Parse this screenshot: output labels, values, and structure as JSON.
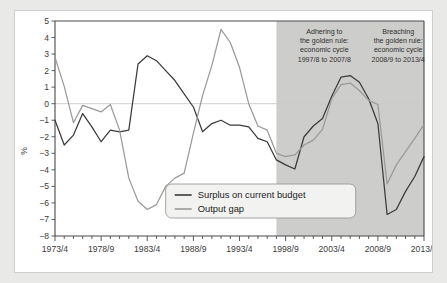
{
  "chart_data": {
    "type": "line",
    "title": "",
    "xlabel": "",
    "ylabel": "%",
    "ylim": [
      -8,
      5
    ],
    "yticks": [
      5,
      4,
      3,
      2,
      1,
      0,
      -1,
      -2,
      -3,
      -4,
      -5,
      -6,
      -7,
      -8
    ],
    "grid": false,
    "zero_line": true,
    "legend_position": "bottom-center",
    "x": [
      "1973/4",
      "1974/5",
      "1975/6",
      "1976/7",
      "1977/8",
      "1978/9",
      "1979/80",
      "1980/1",
      "1981/2",
      "1982/3",
      "1983/4",
      "1984/5",
      "1985/6",
      "1986/7",
      "1987/8",
      "1988/9",
      "1989/90",
      "1990/1",
      "1991/2",
      "1992/3",
      "1993/4",
      "1994/5",
      "1995/6",
      "1996/7",
      "1997/8",
      "1998/9",
      "1999/2000",
      "2000/1",
      "2001/2",
      "2002/3",
      "2003/4",
      "2004/5",
      "2005/6",
      "2006/7",
      "2007/8",
      "2008/9",
      "2009/10",
      "2010/11",
      "2011/12",
      "2012/13",
      "2013/4"
    ],
    "xtick_labels": [
      "1973/4",
      "1978/9",
      "1983/4",
      "1988/9",
      "1993/4",
      "1998/9",
      "2003/4",
      "2008/9",
      "2013/4"
    ],
    "xtick_indices": [
      0,
      5,
      10,
      15,
      20,
      25,
      30,
      35,
      40
    ],
    "series": [
      {
        "name": "Surplus on current budget",
        "color": "#3a3a3a",
        "values": [
          -1.0,
          -2.5,
          -1.9,
          -0.6,
          -1.4,
          -2.3,
          -1.6,
          -1.7,
          -1.6,
          2.4,
          2.9,
          2.6,
          2.0,
          1.4,
          0.6,
          -0.2,
          -1.7,
          -1.2,
          -1.0,
          -1.3,
          -1.3,
          -1.4,
          -2.1,
          -2.3,
          -3.4,
          -3.7,
          -3.95,
          -2.0,
          -1.35,
          -0.9,
          0.45,
          1.6,
          1.7,
          1.3,
          0.3,
          -1.2,
          -1.45,
          -1.0,
          -0.3,
          -0.45,
          -0.75
        ]
      },
      {
        "name": "Output gap",
        "color": "#9a9a9a",
        "values": [
          2.8,
          1.05,
          -1.15,
          -0.1,
          -0.3,
          -0.5,
          -0.05,
          -1.6,
          -4.5,
          -5.9,
          -6.4,
          -6.1,
          -5.0,
          -4.5,
          -4.2,
          -1.8,
          0.5,
          2.3,
          4.5,
          3.7,
          2.2,
          0.0,
          -1.35,
          -1.6,
          -3.0,
          -3.2,
          -3.1,
          -2.5,
          -2.2,
          -1.55,
          0.3,
          1.15,
          1.25,
          0.8,
          0.2,
          -0.05,
          -0.1,
          -0.3,
          0.2,
          0.6,
          -0.2
        ]
      }
    ],
    "series_extension": {
      "note": "tail values continue to 2013/4",
      "surplus_tail": [
        -6.7,
        -6.4,
        -5.3,
        -4.4,
        -3.2
      ],
      "outputgap_tail": [
        -4.85,
        -3.7,
        -2.9,
        -2.1,
        -1.25
      ]
    },
    "shaded_regions": [
      {
        "name": "golden-rule-adhering",
        "start_index": 24,
        "end_index": 40,
        "color": "#cdcdcb"
      }
    ],
    "annotations": [
      {
        "name": "adhering-annotation",
        "lines": [
          "Adhering to",
          "the golden rule:",
          "economic cycle",
          "1997/8 to 2007/8"
        ]
      },
      {
        "name": "breaching-annotation",
        "lines": [
          "Breaching",
          "the golden rule:",
          "economic cycle",
          "2008/9 to 2013/4"
        ]
      }
    ]
  }
}
